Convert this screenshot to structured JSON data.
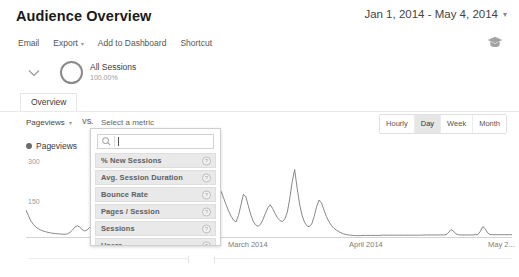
{
  "header": {
    "title": "Audience Overview",
    "date_range": "Jan 1, 2014 - May 4, 2014",
    "date_range_caret": "▾",
    "grad_cap_icon": "graduation-cap-icon"
  },
  "toolbar": {
    "email_label": "Email",
    "export_label": "Export",
    "export_caret": "▾",
    "add_to_dashboard_label": "Add to Dashboard",
    "shortcut_label": "Shortcut"
  },
  "segment": {
    "chevron_icon": "chevron-down-icon",
    "donut_icon": "donut-ring-icon",
    "name": "All Sessions",
    "percent": "100.00%"
  },
  "tabs": [
    {
      "label": "Overview",
      "active": true
    }
  ],
  "metric_selector": {
    "primary_metric": "Pageviews",
    "primary_caret": "▾",
    "vs_label": "VS.",
    "secondary_placeholder": "Select a metric"
  },
  "granularity": {
    "options": [
      {
        "label": "Hourly",
        "active": false
      },
      {
        "label": "Day",
        "active": true
      },
      {
        "label": "Week",
        "active": false
      },
      {
        "label": "Month",
        "active": false
      }
    ]
  },
  "metric_dropdown": {
    "search_icon": "search-icon",
    "search_value": "",
    "search_placeholder": "",
    "items": [
      {
        "label": "% New Sessions",
        "info_icon": "info-icon",
        "info_glyph": "?"
      },
      {
        "label": "Avg. Session Duration",
        "info_icon": "info-icon",
        "info_glyph": "?"
      },
      {
        "label": "Bounce Rate",
        "info_icon": "info-icon",
        "info_glyph": "?"
      },
      {
        "label": "Pages / Session",
        "info_icon": "info-icon",
        "info_glyph": "?"
      },
      {
        "label": "Sessions",
        "info_icon": "info-icon",
        "info_glyph": "?"
      },
      {
        "label": "Users",
        "info_icon": "info-icon",
        "info_glyph": "?"
      }
    ]
  },
  "chart_data": {
    "type": "line",
    "title": "",
    "legend_label": "Pageviews",
    "legend_position": "top-left",
    "xlabel": "",
    "ylabel": "",
    "ylim": [
      0,
      375
    ],
    "yticks": [
      150,
      300
    ],
    "ytick_labels": [
      "150",
      "300"
    ],
    "grid": false,
    "line_color": "#7a7a7a",
    "x_axis_type": "date",
    "xtick_labels": [
      "March 2014",
      "April 2014",
      "May 2..."
    ],
    "series": [
      {
        "name": "Pageviews",
        "values": [
          118,
          96,
          72,
          58,
          47,
          40,
          34,
          30,
          27,
          24,
          22,
          20,
          19,
          18,
          17,
          16,
          16,
          18,
          24,
          34,
          46,
          52,
          46,
          36,
          30,
          34,
          44,
          56,
          60,
          54,
          42,
          30,
          22,
          16,
          12,
          10,
          9,
          8,
          8,
          9,
          10,
          11,
          12,
          12,
          11,
          10,
          9,
          9,
          10,
          12,
          16,
          22,
          30,
          42,
          60,
          84,
          116,
          152,
          196,
          250,
          298,
          236,
          168,
          112,
          74,
          52,
          40,
          34,
          46,
          90,
          62,
          44,
          56,
          86,
          122,
          150,
          170,
          188,
          204,
          212,
          196,
          168,
          140,
          114,
          92,
          76,
          68,
          96,
          140,
          186,
          176,
          138,
          100,
          72,
          56,
          50,
          58,
          78,
          104,
          128,
          142,
          126,
          104,
          86,
          74,
          70,
          82,
          110,
          168,
          240,
          292,
          214,
          146,
          98,
          68,
          52,
          48,
          60,
          92,
          134,
          162,
          150,
          120,
          92,
          70,
          54,
          42,
          34,
          28,
          22,
          18,
          15,
          13,
          12,
          11,
          10,
          10,
          10,
          11,
          11,
          11,
          11,
          11,
          11,
          11,
          11,
          12,
          12,
          12,
          12,
          12,
          12,
          12,
          12,
          12,
          12,
          12,
          12,
          12,
          12,
          12,
          12,
          12,
          13,
          13,
          13,
          13,
          13,
          13,
          13,
          13,
          13,
          14,
          22,
          36,
          30,
          18,
          14,
          13,
          13,
          13,
          13,
          13,
          13,
          14,
          14,
          28,
          48,
          40,
          22,
          15,
          14,
          14,
          14,
          14,
          14,
          14,
          14,
          14,
          14
        ]
      }
    ]
  },
  "x_axis": {
    "ticks": [
      {
        "label": "March 2014",
        "left_px": 228
      },
      {
        "label": "April 2014",
        "left_px": 349
      },
      {
        "label": "May 2...",
        "left_px": 488
      }
    ]
  }
}
